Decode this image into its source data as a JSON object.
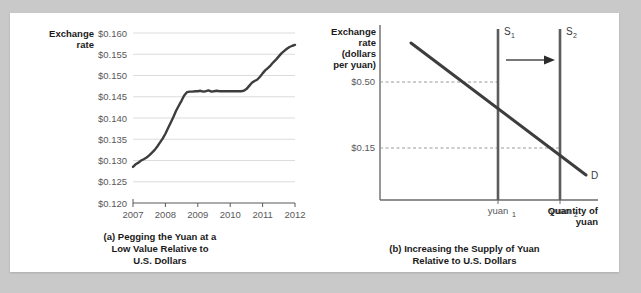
{
  "figure": {
    "background_color": "#c9c9c9",
    "card_color": "#ffffff"
  },
  "panel_a": {
    "y_axis_title_line1": "Exchange",
    "y_axis_title_line2": "rate",
    "caption_line1": "(a) Pegging the Yuan at a",
    "caption_line2": "Low Value Relative to",
    "caption_line3": "U.S. Dollars"
  },
  "panel_b": {
    "y_axis_title_line1": "Exchange",
    "y_axis_title_line2": "rate",
    "y_axis_title_line3": "(dollars",
    "y_axis_title_line4": "per yuan)",
    "x_axis_title_line1": "Quantity of",
    "x_axis_title_line2": "yuan",
    "caption_line1": "(b) Increasing the Supply of Yuan",
    "caption_line2": "Relative to U.S. Dollars",
    "supply1_label": "S",
    "supply1_sub": "1",
    "supply2_label": "S",
    "supply2_sub": "2",
    "demand_label": "D",
    "quantity1_label": "yuan",
    "quantity1_sub": "1",
    "quantity2_label": "yuan",
    "quantity2_sub": "2"
  },
  "chart_data": [
    {
      "type": "line",
      "id": "panel-a-exchange-rate",
      "title": "(a) Pegging the Yuan at a Low Value Relative to U.S. Dollars",
      "xlabel": "",
      "ylabel": "Exchange rate",
      "xlim": [
        2007,
        2012
      ],
      "ylim": [
        0.12,
        0.16
      ],
      "grid": true,
      "legend": "none",
      "ytick_labels": [
        "$0.160",
        "$0.155",
        "$0.150",
        "$0.145",
        "$0.140",
        "$0.135",
        "$0.130",
        "$0.125",
        "$0.120"
      ],
      "ytick_values": [
        0.16,
        0.155,
        0.15,
        0.145,
        0.14,
        0.135,
        0.13,
        0.125,
        0.12
      ],
      "xtick_labels": [
        "2007",
        "2008",
        "2009",
        "2010",
        "2011",
        "2012"
      ],
      "xtick_values": [
        2007,
        2008,
        2009,
        2010,
        2011,
        2012
      ],
      "series": [
        {
          "name": "Dollars per yuan",
          "color": "#3d3d3d",
          "x": [
            2007.0,
            2007.08,
            2007.17,
            2007.25,
            2007.33,
            2007.42,
            2007.5,
            2007.58,
            2007.67,
            2007.75,
            2007.83,
            2007.92,
            2008.0,
            2008.08,
            2008.17,
            2008.25,
            2008.33,
            2008.42,
            2008.5,
            2008.58,
            2008.67,
            2008.75,
            2008.83,
            2008.92,
            2009.0,
            2009.08,
            2009.17,
            2009.25,
            2009.33,
            2009.42,
            2009.5,
            2009.58,
            2009.67,
            2009.75,
            2009.83,
            2009.92,
            2010.0,
            2010.08,
            2010.17,
            2010.25,
            2010.33,
            2010.42,
            2010.5,
            2010.58,
            2010.67,
            2010.75,
            2010.83,
            2010.92,
            2011.0,
            2011.08,
            2011.17,
            2011.25,
            2011.33,
            2011.42,
            2011.5,
            2011.58,
            2011.67,
            2011.75,
            2011.83,
            2011.92,
            2012.0
          ],
          "y": [
            0.1285,
            0.1291,
            0.1295,
            0.13,
            0.1303,
            0.1307,
            0.1312,
            0.1318,
            0.1325,
            0.1333,
            0.1342,
            0.1352,
            0.1363,
            0.1376,
            0.139,
            0.1403,
            0.1417,
            0.143,
            0.1441,
            0.1453,
            0.1461,
            0.1462,
            0.1462,
            0.1463,
            0.1463,
            0.1464,
            0.1462,
            0.1463,
            0.1465,
            0.1462,
            0.1463,
            0.1464,
            0.1463,
            0.1463,
            0.1463,
            0.1463,
            0.1463,
            0.1463,
            0.1463,
            0.1463,
            0.1463,
            0.1464,
            0.1468,
            0.1475,
            0.1483,
            0.1487,
            0.149,
            0.1497,
            0.1505,
            0.1512,
            0.1518,
            0.1524,
            0.1531,
            0.1538,
            0.1545,
            0.1552,
            0.1558,
            0.1563,
            0.1567,
            0.157,
            0.1572
          ]
        }
      ]
    },
    {
      "type": "line",
      "id": "panel-b-supply-demand",
      "title": "(b) Increasing the Supply of Yuan Relative to U.S. Dollars",
      "xlabel": "Quantity of yuan",
      "ylabel": "Exchange rate (dollars per yuan)",
      "grid": false,
      "legend": "inline-labels",
      "ytick_labels": [
        "$0.50",
        "$0.15"
      ],
      "ytick_values": [
        0.5,
        0.15
      ],
      "xtick_labels": [
        "yuan1",
        "yuan2"
      ],
      "annotations": [
        {
          "name": "shift-arrow",
          "text": "",
          "from_x": "yuan1",
          "to_x": "yuan2"
        }
      ],
      "series": [
        {
          "name": "S1",
          "type": "vertical-line",
          "x": "yuan1",
          "color": "#5c5c5c"
        },
        {
          "name": "S2",
          "type": "vertical-line",
          "x": "yuan2",
          "color": "#5c5c5c"
        },
        {
          "name": "D",
          "type": "downward-sloping-line",
          "color": "#3d3d3d",
          "equilibrium_points": [
            {
              "with": "S1",
              "price": 0.5
            },
            {
              "with": "S2",
              "price": 0.15
            }
          ]
        }
      ]
    }
  ]
}
